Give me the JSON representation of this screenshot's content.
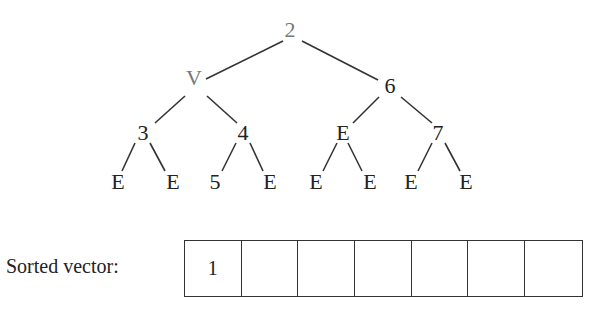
{
  "tree": {
    "nodes": [
      {
        "id": "root",
        "label": "2",
        "x": 290,
        "y": 30,
        "grey": true
      },
      {
        "id": "l",
        "label": "V",
        "x": 194,
        "y": 78,
        "grey": true
      },
      {
        "id": "r",
        "label": "6",
        "x": 390,
        "y": 86,
        "grey": false
      },
      {
        "id": "ll",
        "label": "3",
        "x": 143,
        "y": 133,
        "grey": false
      },
      {
        "id": "lr",
        "label": "4",
        "x": 243,
        "y": 133,
        "grey": false
      },
      {
        "id": "rl",
        "label": "E",
        "x": 343,
        "y": 133,
        "grey": false
      },
      {
        "id": "rr",
        "label": "7",
        "x": 438,
        "y": 133,
        "grey": false
      },
      {
        "id": "lll",
        "label": "E",
        "x": 118,
        "y": 182,
        "grey": false
      },
      {
        "id": "llr",
        "label": "E",
        "x": 173,
        "y": 182,
        "grey": false
      },
      {
        "id": "lrl",
        "label": "5",
        "x": 215,
        "y": 182,
        "grey": false
      },
      {
        "id": "lrr",
        "label": "E",
        "x": 270,
        "y": 182,
        "grey": false
      },
      {
        "id": "rll",
        "label": "E",
        "x": 316,
        "y": 182,
        "grey": false
      },
      {
        "id": "rlr",
        "label": "E",
        "x": 370,
        "y": 182,
        "grey": false
      },
      {
        "id": "rrl",
        "label": "E",
        "x": 411,
        "y": 182,
        "grey": false
      },
      {
        "id": "rrr",
        "label": "E",
        "x": 466,
        "y": 182,
        "grey": false
      }
    ],
    "edges": [
      [
        283,
        41,
        206,
        79
      ],
      [
        302,
        41,
        378,
        80
      ],
      [
        185,
        96,
        155,
        123
      ],
      [
        207,
        96,
        237,
        123
      ],
      [
        379,
        97,
        353,
        123
      ],
      [
        401,
        97,
        432,
        123
      ],
      [
        135,
        143,
        122,
        171
      ],
      [
        150,
        143,
        165,
        171
      ],
      [
        236,
        143,
        222,
        171
      ],
      [
        250,
        143,
        263,
        171
      ],
      [
        337,
        143,
        323,
        171
      ],
      [
        348,
        143,
        362,
        171
      ],
      [
        432,
        143,
        418,
        171
      ],
      [
        445,
        143,
        460,
        171
      ]
    ]
  },
  "vector": {
    "label": "Sorted vector:",
    "cells": [
      "1",
      "",
      "",
      "",
      "",
      "",
      ""
    ]
  }
}
